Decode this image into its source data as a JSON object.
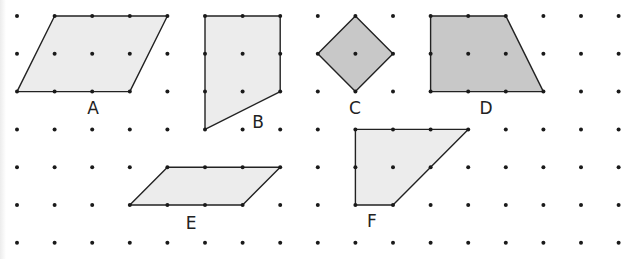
{
  "grid": {
    "columns": 17,
    "rows": 7,
    "origin_x": 17,
    "origin_y": 16,
    "spacing_x": 37.6,
    "spacing_y": 37.8,
    "dot_radius": 2,
    "dot_color": "#1a1a1a"
  },
  "colors": {
    "light_fill": "#ececec",
    "dark_fill": "#c8c8c8",
    "stroke": "#222222"
  },
  "shapes": [
    {
      "label": "A",
      "fill": "light",
      "vertices": [
        [
          1,
          0
        ],
        [
          4,
          0
        ],
        [
          3,
          2
        ],
        [
          0,
          2
        ]
      ],
      "label_pos": [
        93,
        114
      ]
    },
    {
      "label": "B",
      "fill": "light",
      "vertices": [
        [
          5,
          0
        ],
        [
          7,
          0
        ],
        [
          7,
          2
        ],
        [
          5,
          3
        ]
      ],
      "label_pos": [
        258,
        128
      ]
    },
    {
      "label": "C",
      "fill": "dark",
      "vertices": [
        [
          9,
          0
        ],
        [
          10,
          1
        ],
        [
          9,
          2
        ],
        [
          8,
          1
        ]
      ],
      "label_pos": [
        355,
        114
      ]
    },
    {
      "label": "D",
      "fill": "dark",
      "vertices": [
        [
          11,
          0
        ],
        [
          13,
          0
        ],
        [
          14,
          2
        ],
        [
          11,
          2
        ]
      ],
      "label_pos": [
        486,
        114
      ]
    },
    {
      "label": "E",
      "fill": "light",
      "vertices": [
        [
          4,
          4
        ],
        [
          7,
          4
        ],
        [
          6,
          5
        ],
        [
          3,
          5
        ]
      ],
      "label_pos": [
        191,
        229
      ]
    },
    {
      "label": "F",
      "fill": "light",
      "vertices": [
        [
          9,
          3
        ],
        [
          12,
          3
        ],
        [
          10,
          5
        ],
        [
          9,
          5
        ]
      ],
      "label_pos": [
        372,
        227
      ]
    }
  ]
}
